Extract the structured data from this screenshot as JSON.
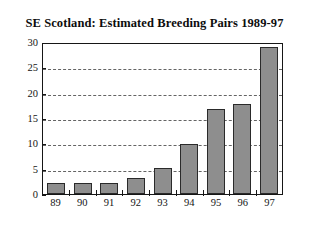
{
  "chart_data": {
    "type": "bar",
    "title": "SE Scotland:  Estimated Breeding Pairs 1989-97",
    "xlabel": "",
    "ylabel": "",
    "categories": [
      "89",
      "90",
      "91",
      "92",
      "93",
      "94",
      "95",
      "96",
      "97"
    ],
    "values": [
      2.2,
      2.2,
      2.2,
      3.3,
      5.3,
      10.0,
      17.0,
      18.0,
      29.5
    ],
    "series": [
      {
        "name": "Estimated Breeding Pairs",
        "values": [
          2.2,
          2.2,
          2.2,
          3.3,
          5.3,
          10.0,
          17.0,
          18.0,
          29.5
        ]
      }
    ],
    "ylim": [
      0,
      30
    ],
    "yticks": [
      0,
      5,
      10,
      15,
      20,
      25,
      30
    ],
    "ytick_labels": [
      "0",
      "5",
      "10",
      "15",
      "20",
      "25",
      "30"
    ],
    "grid": true,
    "grid_style": "dashed-horizontal",
    "legend": false,
    "legend_position": "none",
    "bar_color": "#8e8e8e",
    "bar_edge_color": "#2a2a2a",
    "axis_color": "#161616",
    "background_color": "#ffffff"
  }
}
